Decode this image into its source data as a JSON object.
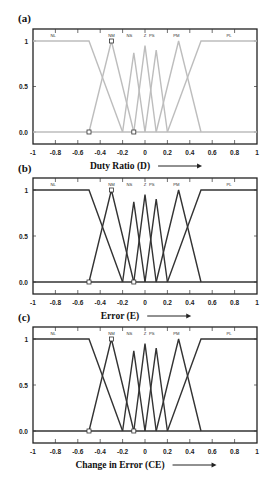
{
  "chart_data": [
    {
      "type": "line",
      "panel_label": "(a)",
      "title": "",
      "xlabel": "Duty Ratio (D)",
      "ylabel": "",
      "xlim": [
        -1,
        1
      ],
      "ylim": [
        -0.1,
        1.1
      ],
      "x_ticks": [
        "-1",
        "-0.8",
        "-0.6",
        "-0.4",
        "-0.2",
        "0",
        "0.2",
        "0.4",
        "0.6",
        "0.8",
        "1"
      ],
      "y_ticks": [
        "0.0",
        "0.5",
        "1"
      ],
      "line_color": "#bdbdbd",
      "grid": false,
      "legend_position": "top-inside",
      "series": [
        {
          "name": "NL",
          "x": [
            -1,
            -0.5,
            -0.2
          ],
          "y": [
            1,
            1,
            0
          ]
        },
        {
          "name": "NM",
          "x": [
            -0.5,
            -0.3,
            -0.1
          ],
          "y": [
            0,
            1,
            0
          ]
        },
        {
          "name": "NS",
          "x": [
            -0.2,
            -0.1,
            0
          ],
          "y": [
            0,
            0.87,
            0
          ]
        },
        {
          "name": "Z",
          "x": [
            -0.1,
            0,
            0.1
          ],
          "y": [
            0,
            0.95,
            0
          ]
        },
        {
          "name": "PS",
          "x": [
            0,
            0.1,
            0.2
          ],
          "y": [
            0,
            0.9,
            0
          ]
        },
        {
          "name": "PM",
          "x": [
            0.1,
            0.3,
            0.5
          ],
          "y": [
            0,
            1,
            0
          ]
        },
        {
          "name": "PL",
          "x": [
            0.2,
            0.5,
            1
          ],
          "y": [
            0,
            1,
            1
          ]
        }
      ],
      "markers": [
        {
          "x": -0.3,
          "y": 1
        },
        {
          "x": -0.5,
          "y": 0
        },
        {
          "x": -0.1,
          "y": 0
        }
      ]
    },
    {
      "type": "line",
      "panel_label": "(b)",
      "title": "",
      "xlabel": "Error (E)",
      "ylabel": "",
      "xlim": [
        -1,
        1
      ],
      "ylim": [
        -0.1,
        1.1
      ],
      "x_ticks": [
        "-1",
        "-0.8",
        "-0.6",
        "-0.4",
        "-0.2",
        "0",
        "0.2",
        "0.4",
        "0.6",
        "0.8",
        "1"
      ],
      "y_ticks": [
        "0.0",
        "0.5",
        "1"
      ],
      "line_color": "#333333",
      "grid": false,
      "legend_position": "top-inside",
      "series": [
        {
          "name": "NL",
          "x": [
            -1,
            -0.5,
            -0.2
          ],
          "y": [
            1,
            1,
            0
          ]
        },
        {
          "name": "NM",
          "x": [
            -0.5,
            -0.3,
            -0.1
          ],
          "y": [
            0,
            1,
            0
          ]
        },
        {
          "name": "NS",
          "x": [
            -0.2,
            -0.1,
            0
          ],
          "y": [
            0,
            0.87,
            0
          ]
        },
        {
          "name": "Z",
          "x": [
            -0.1,
            0,
            0.1
          ],
          "y": [
            0,
            0.95,
            0
          ]
        },
        {
          "name": "PS",
          "x": [
            0,
            0.1,
            0.2
          ],
          "y": [
            0,
            0.9,
            0
          ]
        },
        {
          "name": "PM",
          "x": [
            0.1,
            0.3,
            0.5
          ],
          "y": [
            0,
            1,
            0
          ]
        },
        {
          "name": "PL",
          "x": [
            0.2,
            0.5,
            1
          ],
          "y": [
            0,
            1,
            1
          ]
        }
      ],
      "markers": [
        {
          "x": -0.3,
          "y": 1
        },
        {
          "x": -0.5,
          "y": 0
        },
        {
          "x": -0.1,
          "y": 0
        }
      ]
    },
    {
      "type": "line",
      "panel_label": "(c)",
      "title": "",
      "xlabel": "Change in Error (CE)",
      "ylabel": "",
      "xlim": [
        -1,
        1
      ],
      "ylim": [
        -0.1,
        1.1
      ],
      "x_ticks": [
        "-1",
        "-0.8",
        "-0.6",
        "-0.4",
        "-0.2",
        "0",
        "0.2",
        "0.4",
        "0.6",
        "0.8",
        "1"
      ],
      "y_ticks": [
        "0.0",
        "0.5",
        "1"
      ],
      "line_color": "#333333",
      "grid": false,
      "legend_position": "top-inside",
      "series": [
        {
          "name": "NL",
          "x": [
            -1,
            -0.5,
            -0.2
          ],
          "y": [
            1,
            1,
            0
          ]
        },
        {
          "name": "NM",
          "x": [
            -0.5,
            -0.3,
            -0.1
          ],
          "y": [
            0,
            1,
            0
          ]
        },
        {
          "name": "NS",
          "x": [
            -0.2,
            -0.1,
            0
          ],
          "y": [
            0,
            0.87,
            0
          ]
        },
        {
          "name": "Z",
          "x": [
            -0.1,
            0,
            0.1
          ],
          "y": [
            0,
            0.95,
            0
          ]
        },
        {
          "name": "PS",
          "x": [
            0,
            0.1,
            0.2
          ],
          "y": [
            0,
            0.9,
            0
          ]
        },
        {
          "name": "PM",
          "x": [
            0.1,
            0.3,
            0.5
          ],
          "y": [
            0,
            1,
            0
          ]
        },
        {
          "name": "PL",
          "x": [
            0.2,
            0.5,
            1
          ],
          "y": [
            0,
            1,
            1
          ]
        }
      ],
      "markers": [
        {
          "x": -0.3,
          "y": 1
        },
        {
          "x": -0.5,
          "y": 0
        },
        {
          "x": -0.1,
          "y": 0
        }
      ]
    }
  ],
  "panels": {
    "a": {
      "label": "(a)",
      "xlabel": "Duty Ratio (D)"
    },
    "b": {
      "label": "(b)",
      "xlabel": "Error (E)"
    },
    "c": {
      "label": "(c)",
      "xlabel": "Change in Error (CE)"
    }
  },
  "mf_labels": [
    "NL",
    "NM",
    "NS",
    "Z",
    "PS",
    "PM",
    "PL"
  ],
  "x_ticks": [
    "-1",
    "-0.8",
    "-0.6",
    "-0.4",
    "-0.2",
    "0",
    "0.2",
    "0.4",
    "0.6",
    "0.8",
    "1"
  ],
  "y_ticks": [
    "0.0",
    "0.5",
    "1"
  ]
}
